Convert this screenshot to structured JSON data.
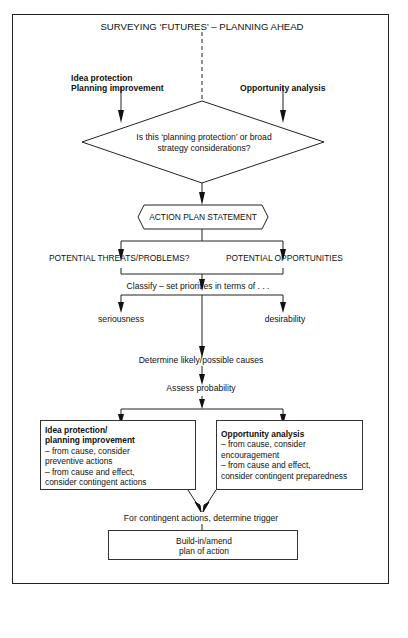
{
  "diagram": {
    "title": "SURVEYING ‘FUTURES’ – PLANNING AHEAD",
    "inputs": {
      "left_line1": "Idea protection",
      "left_line2": "Planning improvement",
      "right": "Opportunity analysis"
    },
    "decision": {
      "line1": "Is this ‘planning protection’ or broad",
      "line2": "strategy considerations?"
    },
    "action_plan": "ACTION PLAN STATEMENT",
    "branches": {
      "threats": "POTENTIAL THREATS/PROBLEMS?",
      "opportunities": "POTENTIAL OPPORTUNITIES"
    },
    "classify": "Classify – set priorities in terms of . . .",
    "criteria": {
      "left": "seriousness",
      "right": "desirability"
    },
    "determine_causes": "Determine likely/possible causes",
    "assess_probability": "Assess probability",
    "left_box": {
      "heading1": "Idea protection/",
      "heading2": "planning improvement",
      "lines": [
        "– from cause, consider",
        "preventive actions",
        "– from cause and effect,",
        "consider contingent actions"
      ]
    },
    "right_box": {
      "heading": "Opportunity analysis",
      "lines": [
        "– from cause, consider",
        "encouragement",
        "– from cause and effect,",
        "consider contingent preparedness"
      ]
    },
    "trigger": "For contingent actions, determine trigger",
    "final_box": {
      "line1": "Build-in/amend",
      "line2": "plan of action"
    }
  }
}
